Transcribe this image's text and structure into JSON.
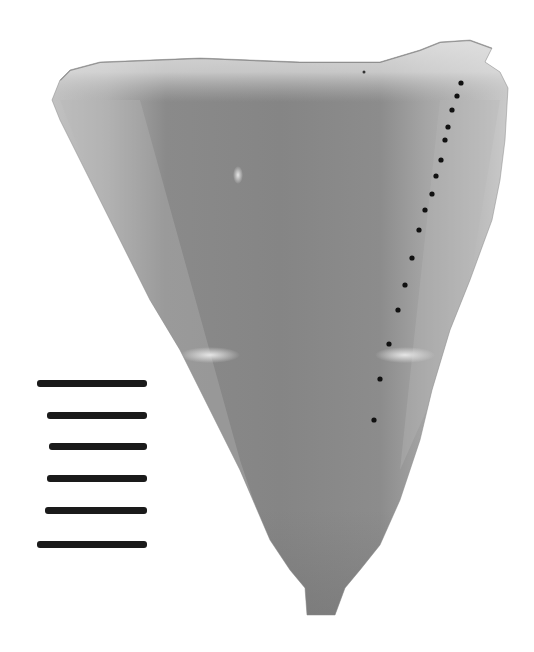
{
  "image": {
    "description": "Grayscale photograph of a tooth (enamel) section with a dotted measurement line and a scale bar",
    "width": 534,
    "height": 652
  },
  "colors": {
    "background": "#ffffff",
    "specimen_edge": "#c9c9c9",
    "specimen_light": "#b4b4b4",
    "specimen_mid": "#8e8e8e",
    "specimen_dark": "#7a7a7a",
    "dots": "#111111",
    "scale_bar": "#1a1a1a"
  },
  "measurement_dots": [
    [
      461,
      83
    ],
    [
      457,
      96
    ],
    [
      452,
      110
    ],
    [
      448,
      127
    ],
    [
      445,
      140
    ],
    [
      441,
      160
    ],
    [
      436,
      176
    ],
    [
      432,
      194
    ],
    [
      425,
      210
    ],
    [
      419,
      230
    ],
    [
      412,
      258
    ],
    [
      405,
      285
    ],
    [
      398,
      310
    ],
    [
      389,
      344
    ],
    [
      380,
      379
    ],
    [
      374,
      420
    ]
  ],
  "scale_bar": {
    "bars": [
      {
        "x": 37,
        "y": 380,
        "w": 110
      },
      {
        "x": 47,
        "y": 412,
        "w": 100
      },
      {
        "x": 49,
        "y": 443,
        "w": 98
      },
      {
        "x": 47,
        "y": 475,
        "w": 100
      },
      {
        "x": 45,
        "y": 507,
        "w": 102
      },
      {
        "x": 37,
        "y": 541,
        "w": 110
      }
    ]
  }
}
